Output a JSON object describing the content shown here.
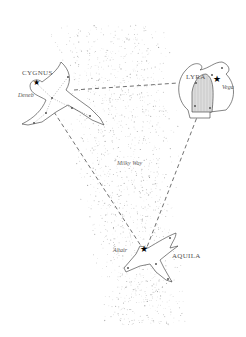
{
  "diagram": {
    "constellations": [
      {
        "name": "CYGNUS",
        "star": "Deneb",
        "label_pos": [
          22,
          70
        ],
        "star_label_pos": [
          18,
          90
        ],
        "star_pos": [
          36,
          83
        ]
      },
      {
        "name": "LYRA",
        "star": "Vega",
        "label_pos": [
          186,
          74
        ],
        "star_label_pos": [
          221,
          84
        ],
        "star_pos": [
          217,
          79
        ]
      },
      {
        "name": "AQUILA",
        "star": "Altair",
        "label_pos": [
          172,
          253
        ],
        "star_label_pos": [
          113,
          248
        ],
        "star_pos": [
          144,
          250
        ]
      }
    ],
    "region_label": "Milky Way",
    "region_label_pos": [
      117,
      160
    ],
    "triangle_line_style": "dashed",
    "colors": {
      "line": "#222222",
      "dots": "#888888",
      "text": "#555555",
      "hatch": "#999999"
    }
  }
}
